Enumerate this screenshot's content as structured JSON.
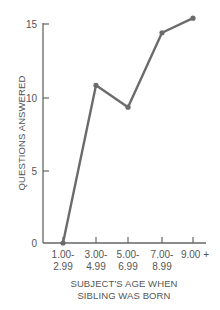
{
  "chart_data": {
    "type": "line",
    "title": "",
    "xlabel": "SUBJECT'S AGE WHEN SIBLING WAS BORN",
    "xlabel_lines": [
      "SUBJECT'S AGE WHEN",
      "SIBLING WAS BORN"
    ],
    "ylabel": "QUESTIONS ANSWERED",
    "categories": [
      "1.00-2.99",
      "3.00-4.99",
      "5.00-6.99",
      "7.00-8.99",
      "9.00 +"
    ],
    "category_lines": [
      [
        "1.00-",
        "2.99"
      ],
      [
        "3.00-",
        "4.99"
      ],
      [
        "5.00-",
        "6.99"
      ],
      [
        "7.00-",
        "8.99"
      ],
      [
        "9.00 +",
        ""
      ]
    ],
    "values": [
      0,
      10.8,
      9.3,
      14.4,
      15.4
    ],
    "yticks": [
      "0",
      "5",
      "10",
      "15"
    ],
    "ylim": [
      0,
      15
    ],
    "grid": false,
    "legend": null,
    "line_color": "#6b6b6b"
  }
}
